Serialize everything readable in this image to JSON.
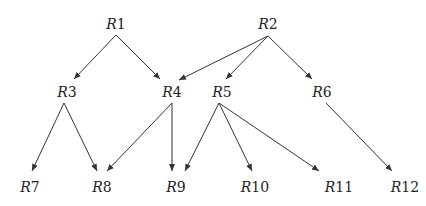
{
  "diagram": {
    "type": "directed-graph",
    "edge_color": "#333333",
    "nodes": [
      {
        "id": "R1",
        "prefix": "R",
        "num": "1",
        "x": 116,
        "y": 24
      },
      {
        "id": "R2",
        "prefix": "R",
        "num": "2",
        "x": 268,
        "y": 24
      },
      {
        "id": "R3",
        "prefix": "R",
        "num": "3",
        "x": 67,
        "y": 92
      },
      {
        "id": "R4",
        "prefix": "R",
        "num": "4",
        "x": 172,
        "y": 92
      },
      {
        "id": "R5",
        "prefix": "R",
        "num": "5",
        "x": 222,
        "y": 92
      },
      {
        "id": "R6",
        "prefix": "R",
        "num": "6",
        "x": 322,
        "y": 92
      },
      {
        "id": "R7",
        "prefix": "R",
        "num": "7",
        "x": 30,
        "y": 187
      },
      {
        "id": "R8",
        "prefix": "R",
        "num": "8",
        "x": 102,
        "y": 187
      },
      {
        "id": "R9",
        "prefix": "R",
        "num": "9",
        "x": 176,
        "y": 187
      },
      {
        "id": "R10",
        "prefix": "R",
        "num": "10",
        "x": 255,
        "y": 187
      },
      {
        "id": "R11",
        "prefix": "R",
        "num": "11",
        "x": 339,
        "y": 187
      },
      {
        "id": "R12",
        "prefix": "R",
        "num": "12",
        "x": 405,
        "y": 187
      }
    ],
    "edges": [
      {
        "from": "R1",
        "to": "R3",
        "x1": 116,
        "y1": 35,
        "x2": 74,
        "y2": 79
      },
      {
        "from": "R1",
        "to": "R4",
        "x1": 116,
        "y1": 35,
        "x2": 160,
        "y2": 79
      },
      {
        "from": "R2",
        "to": "R4",
        "x1": 268,
        "y1": 36,
        "x2": 179,
        "y2": 80
      },
      {
        "from": "R2",
        "to": "R5",
        "x1": 268,
        "y1": 36,
        "x2": 226,
        "y2": 79
      },
      {
        "from": "R2",
        "to": "R6",
        "x1": 268,
        "y1": 36,
        "x2": 312,
        "y2": 79
      },
      {
        "from": "R3",
        "to": "R7",
        "x1": 64,
        "y1": 103,
        "x2": 32,
        "y2": 171
      },
      {
        "from": "R3",
        "to": "R8",
        "x1": 64,
        "y1": 103,
        "x2": 97,
        "y2": 171
      },
      {
        "from": "R4",
        "to": "R8",
        "x1": 172,
        "y1": 103,
        "x2": 107,
        "y2": 171
      },
      {
        "from": "R4",
        "to": "R9",
        "x1": 172,
        "y1": 103,
        "x2": 172,
        "y2": 171
      },
      {
        "from": "R5",
        "to": "R9",
        "x1": 219,
        "y1": 103,
        "x2": 185,
        "y2": 171
      },
      {
        "from": "R5",
        "to": "R10",
        "x1": 219,
        "y1": 103,
        "x2": 252,
        "y2": 171
      },
      {
        "from": "R5",
        "to": "R11",
        "x1": 219,
        "y1": 103,
        "x2": 319,
        "y2": 171
      },
      {
        "from": "R6",
        "to": "R12",
        "x1": 326,
        "y1": 103,
        "x2": 392,
        "y2": 171
      }
    ]
  }
}
